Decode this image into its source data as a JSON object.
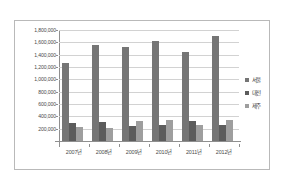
{
  "chart_data": {
    "type": "bar",
    "title": "",
    "subtitle": "",
    "xlabel": "",
    "ylabel": "",
    "categories": [
      "2007년",
      "2008년",
      "2009년",
      "2010년",
      "2011년",
      "2012년"
    ],
    "series": [
      {
        "name": "서울",
        "color": "#757575",
        "values": [
          1270000,
          1565000,
          1520000,
          1620000,
          1440000,
          1700000
        ]
      },
      {
        "name": "대전",
        "color": "#5c5c5c",
        "values": [
          295000,
          305000,
          245000,
          255000,
          320000,
          265000
        ]
      },
      {
        "name": "제주",
        "color": "#9e9e9e",
        "values": [
          225000,
          215000,
          330000,
          340000,
          265000,
          335000
        ]
      }
    ],
    "ylim": [
      0,
      1800000
    ],
    "ytick_values": [
      200000,
      400000,
      600000,
      800000,
      1000000,
      1200000,
      1400000,
      1600000,
      1800000
    ],
    "ytick_labels": [
      "200,000",
      "400,000",
      "600,000",
      "800,000",
      "1,000,000",
      "1,200,000",
      "1,400,000",
      "1,600,000",
      "1,800,000"
    ],
    "grid": true,
    "grid_axis": "y",
    "legend_position": "right",
    "legend_entries": [
      "서울",
      "대전",
      "제주"
    ],
    "annotations": []
  },
  "colors": {
    "grid": "#d2d2d2",
    "axis": "#8f8f8f",
    "frame_border": "#b9b9b9",
    "text": "#4a4a4a",
    "background": "#ffffff"
  }
}
